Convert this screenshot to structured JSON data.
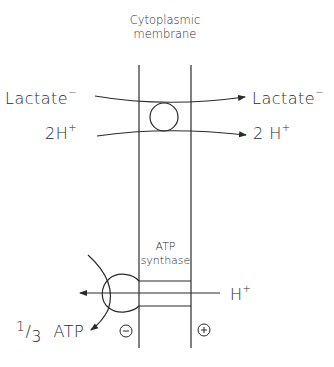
{
  "title": {
    "line1": "Cytoplasmic",
    "line2": "membrane"
  },
  "transport": {
    "lactate_in": "Lactate",
    "lactate_out": "Lactate",
    "lactate_charge": "−",
    "proton_in": "2H",
    "proton_out": "2 H",
    "proton_charge": "+"
  },
  "atp_synthase": {
    "line1": "ATP",
    "line2": "synthase",
    "proton": "H",
    "proton_charge": "+",
    "product_fraction_num": "1",
    "product_fraction_slash": "/",
    "product_fraction_den": "3",
    "product": "ATP",
    "inside_charge": "−",
    "outside_charge": "+"
  },
  "colors": {
    "stroke": "#2a2a2a",
    "background": "#ffffff"
  }
}
